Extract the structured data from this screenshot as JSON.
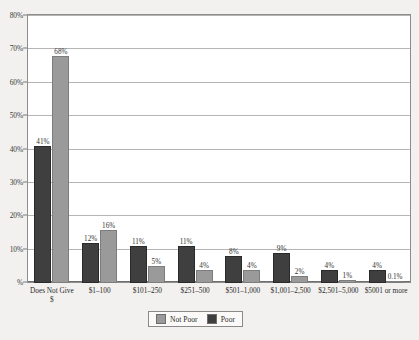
{
  "chart_data": {
    "type": "bar",
    "title": "",
    "xlabel": "",
    "ylabel": "",
    "ylim": [
      0,
      80
    ],
    "grid": true,
    "legend_position": "bottom",
    "categories": [
      "Does Not Give $",
      "$1–100",
      "$101–250",
      "$251–500",
      "$501–1,000",
      "$1,001–2,500",
      "$2,501–5,000",
      "$5001 or more"
    ],
    "ytick_labels": [
      "%",
      "10%",
      "20%",
      "30%",
      "40%",
      "50%",
      "60%",
      "70%",
      "80%"
    ],
    "ytick_values": [
      0,
      10,
      20,
      30,
      40,
      50,
      60,
      70,
      80
    ],
    "series": [
      {
        "name": "Poor",
        "color": "#3f3f3f",
        "values": [
          41,
          12,
          11,
          11,
          8,
          9,
          4,
          4
        ],
        "labels": [
          "41%",
          "12%",
          "11%",
          "11%",
          "8%",
          "9%",
          "4%",
          "4%"
        ]
      },
      {
        "name": "Not Poor",
        "color": "#9a9a9a",
        "values": [
          68,
          16,
          5,
          4,
          4,
          2,
          1,
          0.1
        ],
        "labels": [
          "68%",
          "16%",
          "5%",
          "4%",
          "4%",
          "2%",
          "1%",
          "0.1%"
        ]
      }
    ]
  },
  "legend": {
    "entries": [
      {
        "label": "Not Poor",
        "swatch": "notpoor"
      },
      {
        "label": "Poor",
        "swatch": "poor"
      }
    ]
  }
}
